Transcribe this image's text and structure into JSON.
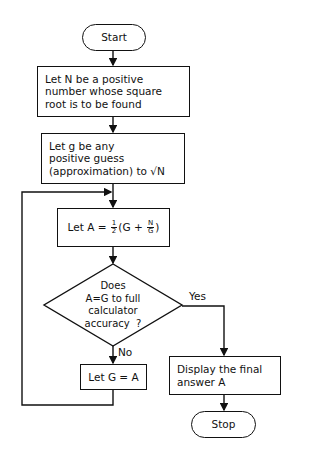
{
  "flowchart": {
    "start": {
      "label": "Start"
    },
    "step1": {
      "lines": [
        "Let N be a positive",
        "number whose square",
        "root is to be found"
      ]
    },
    "step2": {
      "lines": [
        "Let g be any",
        "positive guess",
        "(approximation) to √N"
      ]
    },
    "step3": {
      "prefix": "Let A = ",
      "frac_num": "1",
      "frac_den": "2",
      "open": "(G + ",
      "inner_num": "N",
      "inner_den": "G",
      "close": ")"
    },
    "decision": {
      "lines": [
        "Does",
        "A=G to full",
        "calculator",
        "accuracy  ?"
      ]
    },
    "yes_label": "Yes",
    "no_label": "No",
    "update": {
      "label": "Let G = A"
    },
    "display": {
      "lines": [
        "Display the final",
        "answer A"
      ]
    },
    "stop": {
      "label": "Stop"
    }
  },
  "colors": {
    "stroke": "#111111",
    "background": "#ffffff"
  }
}
